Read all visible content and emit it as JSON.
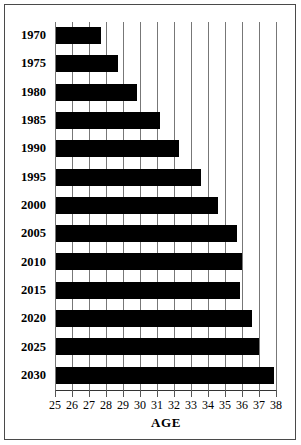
{
  "chart_data": {
    "type": "bar",
    "orientation": "horizontal",
    "title": "",
    "xlabel": "AGE",
    "ylabel": "",
    "categories": [
      "1970",
      "1975",
      "1980",
      "1985",
      "1990",
      "1995",
      "2000",
      "2005",
      "2010",
      "2015",
      "2020",
      "2025",
      "2030"
    ],
    "values": [
      27.7,
      28.7,
      29.8,
      31.2,
      32.3,
      33.6,
      34.6,
      35.7,
      36.0,
      35.9,
      36.6,
      37.0,
      37.9
    ],
    "xlim": [
      25,
      38
    ],
    "xticks": [
      25,
      26,
      27,
      28,
      29,
      30,
      31,
      32,
      33,
      34,
      35,
      36,
      37,
      38
    ],
    "xtick_labels": [
      "25",
      "26",
      "27",
      "28",
      "29",
      "30",
      "31",
      "32",
      "33",
      "34",
      "35",
      "36",
      "37",
      "38"
    ],
    "grid": "vertical",
    "legend": null,
    "bar_color": "#000000",
    "grid_color": "#777777",
    "background_color": "#ffffff",
    "frame_color": "#4a4a4a"
  }
}
